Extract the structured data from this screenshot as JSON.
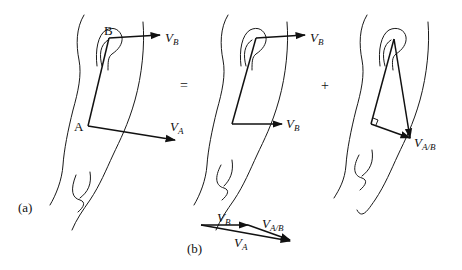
{
  "figure": {
    "panel_a": {
      "label": "(a)",
      "equals_sign": "=",
      "plus_sign": "+",
      "left_arm": {
        "point_b": "B",
        "point_a": "A",
        "vec_b": {
          "main": "V",
          "sub": "B"
        },
        "vec_a": {
          "main": "V",
          "sub": "A"
        }
      },
      "middle_arm": {
        "vec_b_top": {
          "main": "V",
          "sub": "B"
        },
        "vec_b_bottom": {
          "main": "V",
          "sub": "B"
        }
      },
      "right_arm": {
        "vec_ab": {
          "main": "V",
          "sub": "A/B"
        }
      }
    },
    "panel_b": {
      "label": "(b)",
      "vec_b": {
        "main": "V",
        "sub": "B"
      },
      "vec_ab": {
        "main": "V",
        "sub": "A/B"
      },
      "vec_a": {
        "main": "V",
        "sub": "A"
      }
    },
    "colors": {
      "ink": "#111111",
      "background": "#ffffff"
    }
  }
}
